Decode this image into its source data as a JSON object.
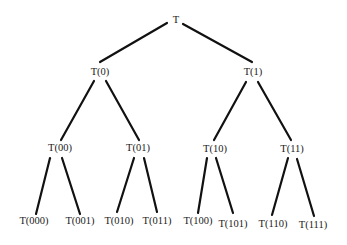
{
  "diagram": {
    "type": "binary-tree",
    "nodes": [
      {
        "id": "T",
        "label": "T",
        "x": 176,
        "y": 21
      },
      {
        "id": "0",
        "label": "T(0)",
        "x": 100,
        "y": 73
      },
      {
        "id": "1",
        "label": "T(1)",
        "x": 253,
        "y": 73
      },
      {
        "id": "00",
        "label": "T(00)",
        "x": 60,
        "y": 149
      },
      {
        "id": "01",
        "label": "T(01)",
        "x": 138,
        "y": 149
      },
      {
        "id": "10",
        "label": "T(10)",
        "x": 215,
        "y": 150
      },
      {
        "id": "11",
        "label": "T(11)",
        "x": 292,
        "y": 150
      },
      {
        "id": "000",
        "label": "T(000)",
        "x": 34,
        "y": 222
      },
      {
        "id": "001",
        "label": "T(001)",
        "x": 80,
        "y": 222
      },
      {
        "id": "010",
        "label": "T(010)",
        "x": 119,
        "y": 222
      },
      {
        "id": "011",
        "label": "T(011)",
        "x": 157,
        "y": 222
      },
      {
        "id": "100",
        "label": "T(100)",
        "x": 198,
        "y": 222
      },
      {
        "id": "101",
        "label": "T(101)",
        "x": 233,
        "y": 225
      },
      {
        "id": "110",
        "label": "T(110)",
        "x": 273,
        "y": 225
      },
      {
        "id": "111",
        "label": "T(111)",
        "x": 313,
        "y": 226
      }
    ],
    "edges": [
      {
        "from": "T",
        "to": "0",
        "x1": 167,
        "y1": 23,
        "x2": 100,
        "y2": 62
      },
      {
        "from": "T",
        "to": "1",
        "x1": 183,
        "y1": 24,
        "x2": 252,
        "y2": 62
      },
      {
        "from": "0",
        "to": "00",
        "x1": 94,
        "y1": 81,
        "x2": 61,
        "y2": 140
      },
      {
        "from": "0",
        "to": "01",
        "x1": 106,
        "y1": 81,
        "x2": 139,
        "y2": 140
      },
      {
        "from": "1",
        "to": "10",
        "x1": 246,
        "y1": 82,
        "x2": 214,
        "y2": 140
      },
      {
        "from": "1",
        "to": "11",
        "x1": 258,
        "y1": 82,
        "x2": 291,
        "y2": 140
      },
      {
        "from": "00",
        "to": "000",
        "x1": 50,
        "y1": 158,
        "x2": 36,
        "y2": 214
      },
      {
        "from": "00",
        "to": "001",
        "x1": 62,
        "y1": 158,
        "x2": 80,
        "y2": 214
      },
      {
        "from": "01",
        "to": "010",
        "x1": 134,
        "y1": 158,
        "x2": 117,
        "y2": 212
      },
      {
        "from": "01",
        "to": "011",
        "x1": 144,
        "y1": 158,
        "x2": 157,
        "y2": 212
      },
      {
        "from": "10",
        "to": "100",
        "x1": 207,
        "y1": 158,
        "x2": 198,
        "y2": 213
      },
      {
        "from": "10",
        "to": "101",
        "x1": 216,
        "y1": 158,
        "x2": 233,
        "y2": 213
      },
      {
        "from": "11",
        "to": "110",
        "x1": 288,
        "y1": 158,
        "x2": 272,
        "y2": 215
      },
      {
        "from": "11",
        "to": "111",
        "x1": 297,
        "y1": 159,
        "x2": 314,
        "y2": 216
      }
    ]
  }
}
